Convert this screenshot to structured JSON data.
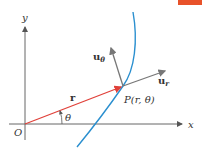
{
  "diagram": {
    "labels": {
      "y_axis": "y",
      "x_axis": "x",
      "origin": "O",
      "position_vector": "r",
      "angle": "θ",
      "point": "P(r, θ)",
      "u_r_main": "u",
      "u_r_sub": "r",
      "u_theta_main": "u",
      "u_theta_sub": "θ"
    },
    "colors": {
      "axes": "#555555",
      "position_vector": "#e0413a",
      "curve": "#2a8fcf",
      "unit_vectors": "#777777",
      "corner_bar": "#e8522a"
    },
    "geometry": {
      "origin": [
        25,
        124
      ],
      "point_P": [
        123,
        86
      ],
      "u_r_tip": [
        166,
        70
      ],
      "u_theta_tip": [
        110,
        46
      ],
      "curve_top": [
        133,
        12
      ],
      "curve_bottom": [
        77,
        147
      ]
    }
  }
}
